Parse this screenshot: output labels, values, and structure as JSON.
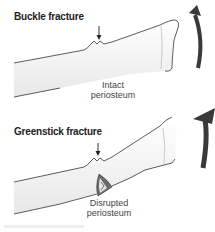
{
  "panels": [
    {
      "title": "Buckle fracture",
      "label_line1": "Intact",
      "label_line2": "periosteum"
    },
    {
      "title": "Greenstick fracture",
      "label_line1": "Disrupted",
      "label_line2": "periosteum"
    }
  ],
  "colors": {
    "bone_fill": "#f4f4f4",
    "outline": "#333333",
    "arrow": "#3a3a3a",
    "fracture_dark": "#555555"
  }
}
